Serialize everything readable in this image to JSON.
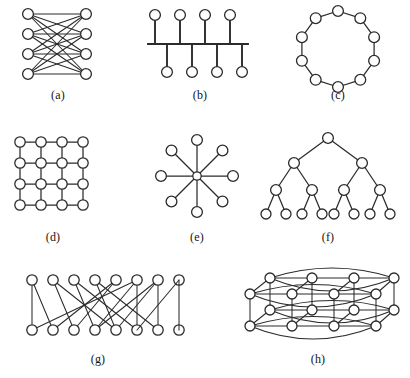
{
  "figure": {
    "background_color": "#ffffff",
    "ink_color": "#2b2b2b",
    "node_fill": "#ffffff",
    "panel_count": 8
  },
  "captions": {
    "a": "(a)",
    "b": "(b)",
    "c": "(c)",
    "d": "(d)",
    "e": "(e)",
    "f": "(f)",
    "g": "(g)",
    "h": "(h)"
  },
  "panels": [
    {
      "key": "a",
      "caption": "(a)",
      "name": "complete-bipartite-graph",
      "description": "Complete bipartite graph K4,4: four nodes in a left column fully connected to four nodes in a right column",
      "node_count": 8,
      "edge_count": 16,
      "left_nodes": 4,
      "right_nodes": 4
    },
    {
      "key": "b",
      "caption": "(b)",
      "name": "bus-topology",
      "description": "Bus / spine topology: a horizontal backbone with four stub nodes above and four stub nodes below",
      "node_count": 8,
      "edge_count": 8,
      "top_stubs": 4,
      "bottom_stubs": 4
    },
    {
      "key": "c",
      "caption": "(c)",
      "name": "ring-topology",
      "description": "Ring topology: ten nodes connected in a single cycle",
      "node_count": 10,
      "edge_count": 10
    },
    {
      "key": "d",
      "caption": "(d)",
      "name": "mesh-grid-topology",
      "description": "Two-dimensional 4 by 4 mesh grid",
      "node_count": 16,
      "edge_count": 24,
      "rows": 4,
      "cols": 4
    },
    {
      "key": "e",
      "caption": "(e)",
      "name": "star-topology",
      "description": "Star topology: one central hub with eight leaf nodes at 45 degree increments",
      "node_count": 9,
      "edge_count": 8,
      "spokes": 8
    },
    {
      "key": "f",
      "caption": "(f)",
      "name": "binary-tree-topology",
      "description": "Complete binary tree of depth four with fifteen nodes",
      "node_count": 15,
      "edge_count": 14,
      "levels": 4
    },
    {
      "key": "g",
      "caption": "(g)",
      "name": "shuffle-exchange-topology",
      "description": "Perfect shuffle / butterfly interconnect: eight top nodes and eight bottom nodes with straight and crossing links",
      "node_count": 16,
      "edge_count": 16,
      "top_nodes": 8,
      "bottom_nodes": 8
    },
    {
      "key": "h",
      "caption": "(h)",
      "name": "torus-topology",
      "description": "Three dimensional torus drawn in perspective: two offset 4 by 4 planes joined by vertical links with curved wrap-around arcs",
      "node_count": 16,
      "planes": 2,
      "rows": 4,
      "cols": 4
    }
  ]
}
